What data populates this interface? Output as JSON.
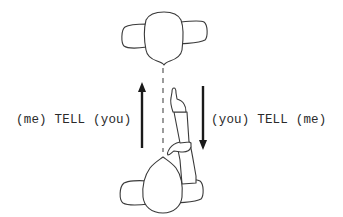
{
  "diagram": {
    "labels": {
      "left": "(me) TELL (you)",
      "right": "(you) TELL (me)"
    },
    "elements": {
      "top_person": "person-top-view",
      "bottom_person": "person-top-view-pointing",
      "sight_line": "dashed-line",
      "up_arrow": "arrow-up",
      "down_arrow": "arrow-down"
    },
    "colors": {
      "stroke": "#3a3a3a",
      "arrow": "#1a1a1a",
      "background": "#ffffff"
    }
  }
}
